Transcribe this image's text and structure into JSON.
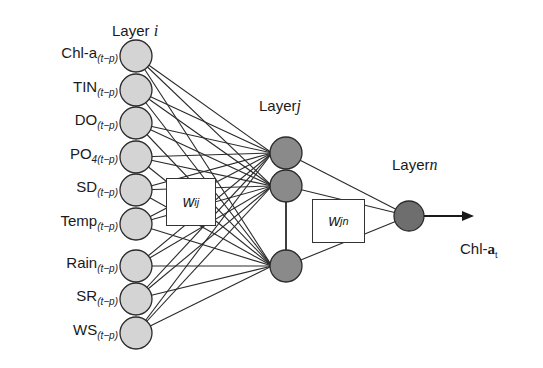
{
  "diagram": {
    "type": "neural-network",
    "layers": {
      "input": {
        "title_prefix": "Layer",
        "title_var": "i",
        "nodes": [
          {
            "name": "Chl-a",
            "sub": "(t−p)"
          },
          {
            "name": "TIN",
            "sub": "(t−p)"
          },
          {
            "name": "DO",
            "sub": "(t−p)"
          },
          {
            "name": "PO",
            "sub": "4(t−p)"
          },
          {
            "name": "SD",
            "sub": "(t−p)"
          },
          {
            "name": "Temp",
            "sub": "(t−p)"
          },
          {
            "name": "Rain",
            "sub": "(t−p)"
          },
          {
            "name": "SR",
            "sub": "(t−p)"
          },
          {
            "name": "WS",
            "sub": "(t−p)"
          }
        ]
      },
      "hidden": {
        "title_prefix": "Layer",
        "title_var": "j",
        "node_count": 3
      },
      "output": {
        "title_prefix": "Layer",
        "title_var": "n",
        "node_count": 1
      }
    },
    "weights": {
      "input_hidden": {
        "w": "w",
        "sub": "ij"
      },
      "hidden_output": {
        "w": "w",
        "sub": "jn"
      }
    },
    "output_label": {
      "name": "Chl-",
      "bold": "a",
      "sub": "t"
    },
    "colors": {
      "input_node": "#d4d4d4",
      "hidden_node": "#8a8a8a",
      "output_node": "#6e6e6e",
      "stroke": "#2a2a2a"
    }
  }
}
